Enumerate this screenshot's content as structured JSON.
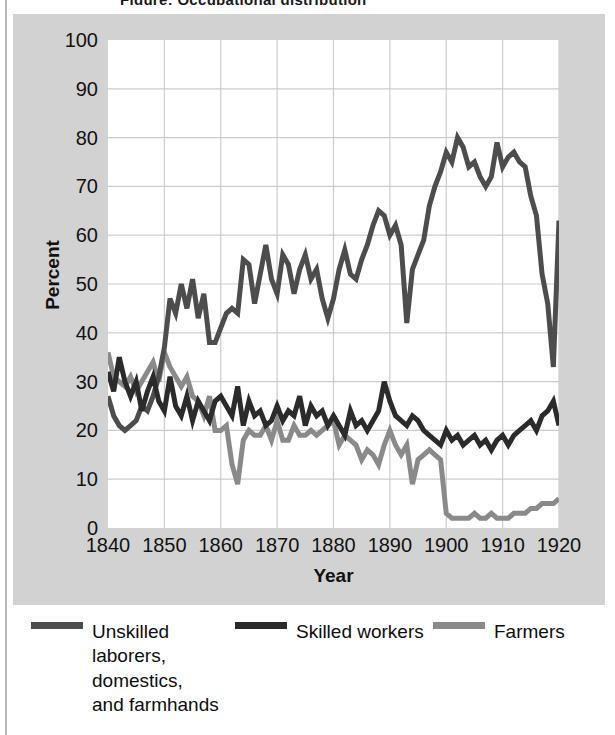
{
  "title": "Figure: Occupational distribution",
  "axes": {
    "ylabel": "Percent",
    "xlabel": "Year",
    "yticks": [
      "0",
      "10",
      "20",
      "30",
      "40",
      "50",
      "60",
      "70",
      "80",
      "90",
      "100"
    ],
    "xticks": [
      "1840",
      "1850",
      "1860",
      "1870",
      "1880",
      "1890",
      "1900",
      "1910",
      "1920"
    ]
  },
  "legend": {
    "unskilled_label": "Unskilled\nlaborers,\ndomestics,\nand farmhands",
    "skilled_label": "Skilled workers",
    "farmers_label": "Farmers"
  },
  "colors": {
    "unskilled": "#4d4d4d",
    "skilled": "#2b2b2b",
    "farmers": "#8a8a8a",
    "panel": "#d2d2d2",
    "plot_bg": "#ffffff",
    "grid": "#cccccc",
    "text": "#121212"
  },
  "chart_data": {
    "type": "line",
    "title": "Figure: Occupational distribution",
    "xlabel": "Year",
    "ylabel": "Percent",
    "xlim": [
      1840,
      1920
    ],
    "ylim": [
      0,
      100
    ],
    "grid": true,
    "legend_position": "bottom",
    "x": [
      1840,
      1841,
      1842,
      1843,
      1844,
      1845,
      1846,
      1847,
      1848,
      1849,
      1850,
      1851,
      1852,
      1853,
      1854,
      1855,
      1856,
      1857,
      1858,
      1859,
      1860,
      1861,
      1862,
      1863,
      1864,
      1865,
      1866,
      1867,
      1868,
      1869,
      1870,
      1871,
      1872,
      1873,
      1874,
      1875,
      1876,
      1877,
      1878,
      1879,
      1880,
      1881,
      1882,
      1883,
      1884,
      1885,
      1886,
      1887,
      1888,
      1889,
      1890,
      1891,
      1892,
      1893,
      1894,
      1895,
      1896,
      1897,
      1898,
      1899,
      1900,
      1901,
      1902,
      1903,
      1904,
      1905,
      1906,
      1907,
      1908,
      1909,
      1910,
      1911,
      1912,
      1913,
      1914,
      1915,
      1916,
      1917,
      1918,
      1919,
      1920
    ],
    "series": [
      {
        "name": "Unskilled laborers, domestics, and farmhands",
        "color": "#4d4d4d",
        "values": [
          27,
          23,
          21,
          20,
          21,
          22,
          25,
          24,
          27,
          31,
          37,
          47,
          44,
          50,
          45,
          51,
          43,
          48,
          38,
          38,
          41,
          44,
          45,
          44,
          55,
          54,
          46,
          52,
          58,
          51,
          48,
          56,
          54,
          48,
          53,
          56,
          51,
          53,
          47,
          43,
          47,
          53,
          57,
          52,
          51,
          55,
          58,
          62,
          65,
          64,
          60,
          62,
          58,
          42,
          53,
          56,
          59,
          66,
          70,
          73,
          77,
          75,
          80,
          78,
          74,
          75,
          72,
          70,
          72,
          79,
          74,
          76,
          77,
          75,
          74,
          68,
          64,
          52,
          46,
          33,
          63
        ]
      },
      {
        "name": "Skilled workers",
        "color": "#2b2b2b",
        "values": [
          32,
          28,
          35,
          30,
          27,
          30,
          24,
          28,
          31,
          26,
          24,
          31,
          25,
          23,
          27,
          22,
          26,
          24,
          22,
          26,
          27,
          25,
          23,
          29,
          21,
          26,
          23,
          24,
          21,
          22,
          25,
          22,
          24,
          23,
          27,
          21,
          25,
          23,
          24,
          21,
          23,
          21,
          19,
          24,
          21,
          22,
          20,
          22,
          24,
          30,
          26,
          23,
          22,
          21,
          23,
          22,
          20,
          19,
          18,
          17,
          20,
          18,
          19,
          17,
          18,
          19,
          17,
          18,
          16,
          18,
          19,
          17,
          19,
          20,
          21,
          22,
          20,
          23,
          24,
          26,
          21
        ]
      },
      {
        "name": "Farmers",
        "color": "#8a8a8a",
        "values": [
          36,
          31,
          30,
          29,
          31,
          28,
          30,
          32,
          34,
          30,
          36,
          33,
          31,
          29,
          31,
          27,
          26,
          23,
          27,
          20,
          20,
          21,
          13,
          9,
          18,
          20,
          19,
          19,
          21,
          18,
          22,
          18,
          18,
          21,
          19,
          19,
          20,
          19,
          20,
          21,
          22,
          17,
          19,
          18,
          17,
          14,
          16,
          15,
          13,
          17,
          20,
          17,
          15,
          17,
          9,
          14,
          15,
          16,
          15,
          14,
          3,
          2,
          2,
          2,
          2,
          3,
          2,
          2,
          3,
          2,
          2,
          2,
          3,
          3,
          3,
          4,
          4,
          5,
          5,
          5,
          6
        ]
      }
    ]
  }
}
